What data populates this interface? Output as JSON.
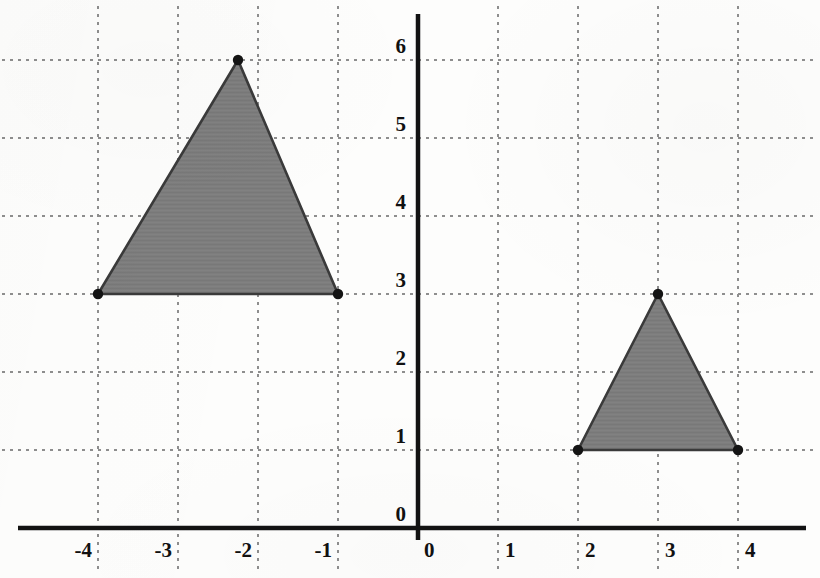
{
  "figure": {
    "kind": "coordinate-plane-with-triangles",
    "background_color": "#fdfdfc"
  },
  "chart_data": {
    "type": "scatter",
    "title": "",
    "xlabel": "",
    "ylabel": "",
    "xlim": [
      -4.85,
      5.0
    ],
    "ylim": [
      -0.55,
      6.55
    ],
    "grid": true,
    "grid_style": "dotted",
    "grid_color": "#8e8e8e",
    "axis_color": "#121212",
    "legend": "none",
    "xticks": [
      -4,
      -3,
      -2,
      -1,
      0,
      1,
      2,
      3,
      4
    ],
    "yticks": [
      0,
      1,
      2,
      3,
      4,
      5,
      6
    ],
    "xtick_labels": [
      "-4",
      "-3",
      "-2",
      "-1",
      "0",
      "1",
      "2",
      "3",
      "4"
    ],
    "ytick_labels": [
      "0",
      "1",
      "2",
      "3",
      "4",
      "5",
      "6"
    ],
    "origin_label": "0",
    "series": [
      {
        "name": "large-triangle",
        "shape": "triangle",
        "fill": "#7d7d7d",
        "edge": "#3a3a3a",
        "vertices": [
          {
            "x": -4.0,
            "y": 3.0
          },
          {
            "x": -1.0,
            "y": 3.0
          },
          {
            "x": -2.25,
            "y": 6.0
          }
        ],
        "vertex_marker": "filled-circle"
      },
      {
        "name": "small-triangle",
        "shape": "triangle",
        "fill": "#7d7d7d",
        "edge": "#3a3a3a",
        "vertices": [
          {
            "x": 2.0,
            "y": 1.0
          },
          {
            "x": 4.0,
            "y": 1.0
          },
          {
            "x": 3.0,
            "y": 3.0
          }
        ],
        "vertex_marker": "filled-circle"
      }
    ]
  },
  "axes": {
    "x_axis_label": "",
    "y_axis_label": "",
    "origin_tick": "0"
  }
}
